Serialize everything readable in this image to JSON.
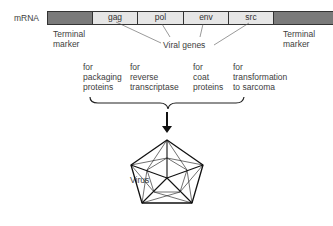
{
  "diagram": {
    "strand_label": "mRNA",
    "segments": [
      {
        "name": "terminal-left",
        "label": "",
        "type": "terminal"
      },
      {
        "name": "gag",
        "label": "gag",
        "type": "gene"
      },
      {
        "name": "pol",
        "label": "pol",
        "type": "gene"
      },
      {
        "name": "env",
        "label": "env",
        "type": "gene"
      },
      {
        "name": "src",
        "label": "src",
        "type": "gene"
      },
      {
        "name": "terminal-right",
        "label": "",
        "type": "terminal"
      }
    ],
    "terminal_left_label": "Terminal\nmarker",
    "terminal_right_label": "Terminal\nmarker",
    "viral_genes_label": "Viral genes",
    "functions": [
      {
        "gene": "gag",
        "text": "for\npackaging\nproteins"
      },
      {
        "gene": "pol",
        "text": "for\nreverse\ntranscriptase"
      },
      {
        "gene": "env",
        "text": "for\ncoat\nproteins"
      },
      {
        "gene": "src",
        "text": "for\ntransformation\nto sarcoma"
      }
    ],
    "virus_label": "Virus",
    "colors": {
      "terminal": "#7a7a7a",
      "gene": "#e6e6e6",
      "outline": "#333333"
    }
  }
}
